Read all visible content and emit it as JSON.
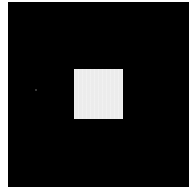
{
  "image": {
    "background_color": "#000000",
    "frame_color": "#ffffff",
    "square_color": "#ececec",
    "dot_color": "#4a4a4a"
  }
}
